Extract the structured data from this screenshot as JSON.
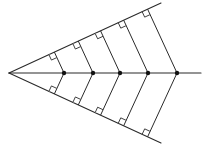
{
  "diagram": {
    "type": "angle-bisector-perpendiculars",
    "colors": {
      "line": "#2a2a2a",
      "point": "#111111",
      "background": "#ffffff"
    },
    "apex": [
      9,
      73
    ],
    "upper_ray_end": [
      161,
      3
    ],
    "lower_ray_end": [
      161,
      143
    ],
    "bisector_end": [
      201,
      73
    ],
    "bisector_points_x": [
      64,
      93,
      120,
      148,
      177
    ],
    "point_radius": 2.2,
    "right_angle_mark_size": 6
  }
}
